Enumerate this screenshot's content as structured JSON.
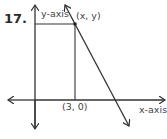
{
  "problem": {
    "number": "17."
  },
  "labels": {
    "y_axis": "y-axis",
    "x_axis": "x-axis",
    "point": "(x, y)",
    "x_intercept_point": "(3, 0)"
  },
  "colors": {
    "line": "#333333",
    "text": "#444444",
    "background": "#ffffff"
  }
}
